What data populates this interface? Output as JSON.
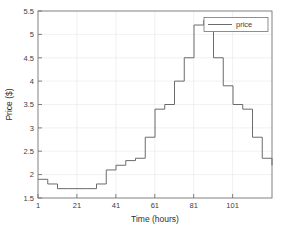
{
  "chart_data": {
    "type": "line",
    "subtype": "stairs",
    "title": "",
    "xlabel": "Time (hours)",
    "ylabel": "Price ($)",
    "xlim": [
      1,
      121
    ],
    "ylim": [
      1.5,
      5.5
    ],
    "xticks": [
      1,
      21,
      41,
      61,
      81,
      101
    ],
    "yticks": [
      1.5,
      2,
      2.5,
      3,
      3.5,
      4,
      4.5,
      5,
      5.5
    ],
    "xticklabels": [
      "1",
      "21",
      "41",
      "61",
      "81",
      "101"
    ],
    "yticklabels": [
      "1.5",
      "2",
      "2.5",
      "3",
      "3.5",
      "4",
      "4.5",
      "5",
      "5.5"
    ],
    "grid": true,
    "legend": {
      "position": "top-right",
      "entries": [
        "price"
      ]
    },
    "series": [
      {
        "name": "price",
        "color": "#6b6b6b",
        "x": [
          1,
          6,
          11,
          16,
          21,
          26,
          31,
          36,
          41,
          46,
          51,
          56,
          61,
          66,
          71,
          76,
          81,
          86,
          91,
          96,
          101,
          106,
          111,
          116,
          121
        ],
        "values": [
          1.9,
          1.8,
          1.7,
          1.7,
          1.7,
          1.7,
          1.8,
          2.1,
          2.2,
          2.3,
          2.35,
          2.8,
          3.4,
          3.5,
          4.0,
          4.5,
          5.2,
          5.3,
          4.5,
          3.9,
          3.5,
          3.4,
          2.8,
          2.35,
          2.2
        ]
      }
    ]
  },
  "axes": {
    "x_title": "Time (hours)",
    "y_title": "Price ($)"
  },
  "legend": {
    "price_label": "price"
  }
}
